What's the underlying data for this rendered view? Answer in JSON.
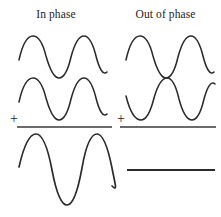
{
  "figure": {
    "background_color": "#ffffff",
    "stroke_color": "#2b2b2b"
  },
  "columns": [
    {
      "id": "in-phase",
      "heading": "In phase",
      "operator": "+",
      "result_type": "wave",
      "description": "Two identical waves in phase add constructively to give a wave of doubled amplitude."
    },
    {
      "id": "out-of-phase",
      "heading": "Out of phase",
      "operator": "+",
      "result_type": "flat-line",
      "description": "Two identical waves 180 degrees out of phase cancel to give a flat line."
    }
  ],
  "chart_data": {
    "type": "line",
    "xlabel": "",
    "ylabel": "",
    "panels": [
      {
        "column": "In phase",
        "waves": [
          {
            "name": "wave-1",
            "phase_deg": 0,
            "amplitude": 1,
            "cycles": 2
          },
          {
            "name": "wave-2",
            "phase_deg": 0,
            "amplitude": 1,
            "cycles": 2
          },
          {
            "name": "sum",
            "phase_deg": 0,
            "amplitude": 2,
            "cycles": 2
          }
        ]
      },
      {
        "column": "Out of phase",
        "waves": [
          {
            "name": "wave-1",
            "phase_deg": 0,
            "amplitude": 1,
            "cycles": 2
          },
          {
            "name": "wave-2",
            "phase_deg": 180,
            "amplitude": 1,
            "cycles": 2
          },
          {
            "name": "sum",
            "phase_deg": 0,
            "amplitude": 0,
            "cycles": 0
          }
        ]
      }
    ]
  },
  "geometry": {
    "left_wave_1": "M 19,60 C 23,42 28,36 33,36 C 39,36 43,44 46,56 C 50,70 54,78 59,78 C 64,78 68,70 71,57 C 75,42 79,36 84,36 C 89,36 93,44 96,56 C 99,68 103,76 107,72",
    "left_wave_2": "M 19,102 C 23,84 28,78 33,78 C 39,78 43,86 46,98 C 50,112 54,120 59,120 C 64,120 68,112 71,99 C 75,84 79,78 84,78 C 89,78 93,86 96,98 C 99,110 103,118 107,114",
    "left_sum": "M 19,167 C 24,145 30,134 36,134 C 43,134 48,149 52,170 C 56,191 61,205 67,205 C 73,205 78,190 82,168 C 86,145 91,134 97,134 C 103,134 108,148 112,168 C 115,184 118,192 112,186",
    "right_wave_1": "M 126,60 C 130,42 135,36 140,36 C 146,36 150,44 153,56 C 157,70 161,78 166,78 C 171,78 175,70 178,57 C 182,42 186,36 191,36 C 196,36 200,44 203,56 C 206,68 210,76 214,72",
    "right_wave_2": "M 126,96 C 130,112 135,120 141,120 C 147,120 151,110 154,98 C 158,84 162,78 167,78 C 172,78 176,86 179,99 C 183,114 187,120 192,120 C 197,120 201,112 204,99 C 207,88 211,80 215,84",
    "left_rule": {
      "x1": 17,
      "y1": 127,
      "x2": 112,
      "y2": 127
    },
    "right_rule": {
      "x1": 120,
      "y1": 127,
      "x2": 216,
      "y2": 127
    },
    "flat_result": {
      "x1": 127,
      "y1": 170,
      "x2": 215,
      "y2": 170
    }
  }
}
